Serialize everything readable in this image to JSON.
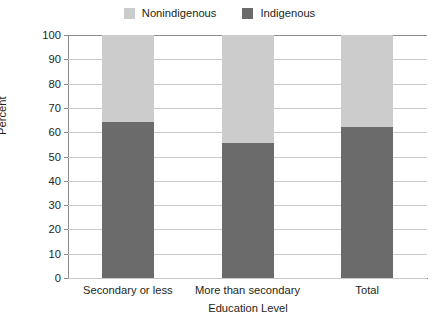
{
  "chart_data": {
    "type": "bar",
    "subtype": "stacked-percentage",
    "title": "",
    "xlabel": "Education Level",
    "ylabel": "Percent",
    "ylim": [
      0,
      100
    ],
    "ytick_step": 10,
    "yticks": [
      "100",
      "90",
      "80",
      "70",
      "60",
      "50",
      "40",
      "30",
      "20",
      "10",
      "0"
    ],
    "grid": true,
    "legend_position": "top-center",
    "categories": [
      "Secondary or less",
      "More than secondary",
      "Total"
    ],
    "series": [
      {
        "name": "Indigenous",
        "color": "#6b6b6b",
        "values": [
          64,
          55.5,
          62
        ]
      },
      {
        "name": "Nonindigenous",
        "color": "#cccccc",
        "values": [
          36,
          44.5,
          38
        ]
      }
    ]
  },
  "legend": {
    "items": [
      {
        "label": "Nonindigenous",
        "color": "#cccccc"
      },
      {
        "label": "Indigenous",
        "color": "#6b6b6b"
      }
    ]
  },
  "axes": {
    "y_title": "Percent",
    "x_title": "Education Level"
  }
}
